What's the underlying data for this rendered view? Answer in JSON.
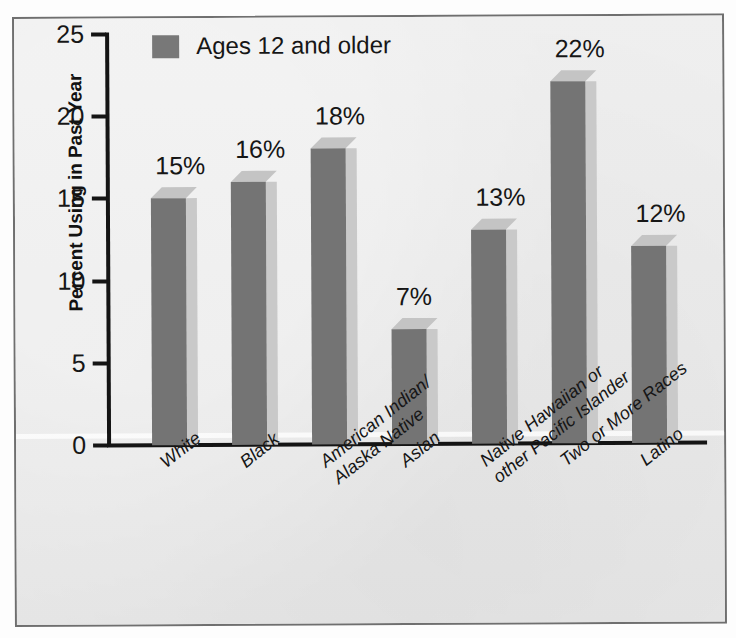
{
  "top_crumb": "",
  "chart_data": {
    "type": "bar",
    "title": "",
    "xlabel": "",
    "ylabel": "Percent Using in Past Year",
    "ylim": [
      0,
      25
    ],
    "yticks": [
      0,
      5,
      10,
      15,
      20,
      25
    ],
    "grid": false,
    "legend_position": "top-left",
    "legend": [
      "Ages 12 and older"
    ],
    "categories": [
      "White",
      "Black",
      "American Indian/\nAlaska Native",
      "Asian",
      "Native Hawaiian or\nother Pacific Islander",
      "Two or More Races",
      "Latino"
    ],
    "values": [
      15,
      16,
      18,
      7,
      13,
      22,
      12
    ],
    "value_labels": [
      "15%",
      "16%",
      "18%",
      "7%",
      "13%",
      "22%",
      "12%"
    ],
    "series": [
      {
        "name": "Ages 12 and older",
        "values": [
          15,
          16,
          18,
          7,
          13,
          22,
          12
        ]
      }
    ]
  },
  "axis": {
    "y_title": "Percent Using in Past Year",
    "y_tick_labels": [
      "25",
      "20",
      "15",
      "10",
      "5",
      "0"
    ],
    "x_tick_labels": [
      {
        "line1": "White",
        "line2": ""
      },
      {
        "line1": "Black",
        "line2": ""
      },
      {
        "line1": "American Indian/",
        "line2": "Alaska Native"
      },
      {
        "line1": "Asian",
        "line2": ""
      },
      {
        "line1": "Native Hawaiian or",
        "line2": "other Pacific Islander"
      },
      {
        "line1": "Two or More Races",
        "line2": ""
      },
      {
        "line1": "Latino",
        "line2": ""
      }
    ]
  },
  "legend": {
    "label": "Ages 12 and older"
  },
  "colors": {
    "bar_front": "#747474",
    "bar_side": "#c9c9c9",
    "bar_top": "#c4c4c4",
    "axis": "#141414",
    "background": "#ececec",
    "frame": "#6f6f6f",
    "text": "#161616"
  }
}
